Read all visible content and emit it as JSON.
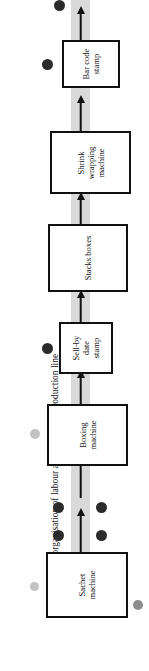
{
  "figure": {
    "caption_label": "Figure 4.5:",
    "caption_text": " The organisation of labour along a Moir's production line",
    "orientation": "rotated-90-ccw",
    "flow_direction": "bottom-to-top"
  },
  "diagram": {
    "type": "process-flow",
    "band_color": "#d9d9d9",
    "box_border_color": "#111111",
    "box_fill_color": "#ffffff",
    "worker_dot_dark_color": "#2b2b2b",
    "worker_dot_grey_color": "#b6b6b6",
    "worker_dot_mid_color": "#8c8c8c",
    "stations": [
      {
        "id": "sachet-machine",
        "label": "Sachet\nmachine",
        "order": 1
      },
      {
        "id": "boxing-machine",
        "label": "Boxing\nmachine",
        "order": 2
      },
      {
        "id": "sell-by-stamp",
        "label": "Sell-by\ndate\nstamp",
        "order": 3
      },
      {
        "id": "stacks-boxes",
        "label": "Stacks boxes",
        "order": 4
      },
      {
        "id": "shrink-wrapping",
        "label": "Shrink\nwrapping\nmachine",
        "order": 5
      },
      {
        "id": "bar-code-stamp",
        "label": "Bar code\nstamp",
        "order": 6
      }
    ],
    "arrow_count": 7,
    "worker_dots": [
      {
        "id": "worker-1",
        "shade": "grey",
        "side": "left",
        "near": "sachet-machine"
      },
      {
        "id": "worker-2",
        "shade": "mid",
        "side": "right",
        "near": "sachet-machine"
      },
      {
        "id": "worker-3",
        "shade": "dark",
        "side": "left",
        "near": "sachet-boxing-link"
      },
      {
        "id": "worker-4",
        "shade": "dark",
        "side": "right",
        "near": "sachet-boxing-link"
      },
      {
        "id": "worker-5",
        "shade": "dark",
        "side": "left",
        "near": "boxing-machine-inlet"
      },
      {
        "id": "worker-6",
        "shade": "dark",
        "side": "right",
        "near": "boxing-machine-inlet"
      },
      {
        "id": "worker-7",
        "shade": "grey",
        "side": "left",
        "near": "boxing-machine"
      },
      {
        "id": "worker-8",
        "shade": "dark",
        "side": "left",
        "near": "sell-by-stamp"
      },
      {
        "id": "worker-9",
        "shade": "dark",
        "side": "left",
        "near": "bar-code-stamp"
      },
      {
        "id": "worker-10",
        "shade": "dark",
        "side": "left",
        "near": "line-outlet"
      }
    ]
  }
}
